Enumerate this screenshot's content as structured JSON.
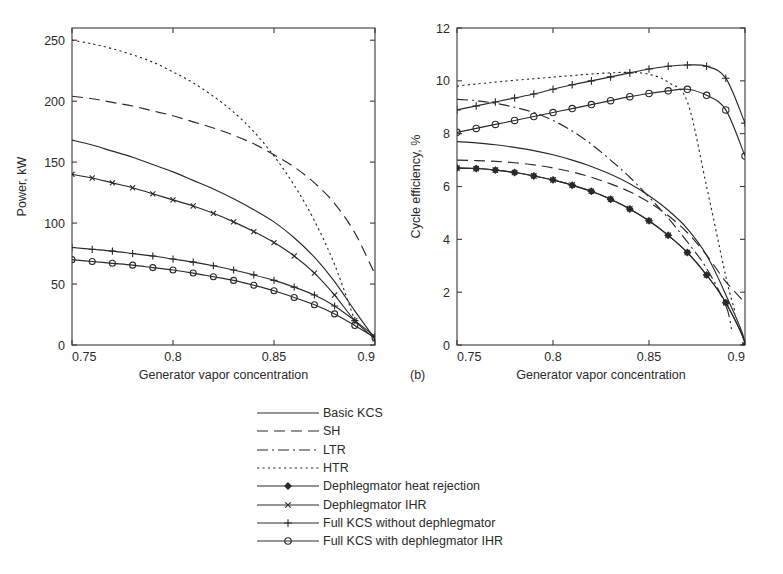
{
  "figure": {
    "panels": [
      {
        "id": "a",
        "letter": "",
        "xlabel": "Generator vapor concentration",
        "ylabel": "Power, kW",
        "xticks": [
          "0.75",
          "0.8",
          "0.85",
          "0.9"
        ],
        "yticks": [
          "0",
          "50",
          "100",
          "150",
          "200",
          "250"
        ]
      },
      {
        "id": "b",
        "letter": "(b)",
        "xlabel": "Generator vapor concentration",
        "ylabel": "Cycle efficiency, %",
        "xticks": [
          "0.75",
          "0.8",
          "0.85",
          "0.9"
        ],
        "yticks": [
          "0",
          "2",
          "4",
          "6",
          "8",
          "10",
          "12"
        ]
      }
    ]
  },
  "legend": {
    "items": [
      {
        "label": "Basic KCS",
        "style": "solid",
        "marker": "none"
      },
      {
        "label": "SH",
        "style": "dashed",
        "marker": "none"
      },
      {
        "label": "LTR",
        "style": "dashdot",
        "marker": "none"
      },
      {
        "label": "HTR",
        "style": "dotted",
        "marker": "none"
      },
      {
        "label": "Dephlegmator heat rejection",
        "style": "solid",
        "marker": "diamond"
      },
      {
        "label": "Dephlegmator IHR",
        "style": "solid",
        "marker": "cross"
      },
      {
        "label": "Full KCS without dephlegmator",
        "style": "solid",
        "marker": "plus"
      },
      {
        "label": "Full KCS with dephlegmator IHR",
        "style": "solid",
        "marker": "circle"
      }
    ]
  },
  "caption": {
    "text": ""
  },
  "chart_data": [
    {
      "type": "line",
      "panel": "a",
      "title": "",
      "xlabel": "Generator vapor concentration",
      "ylabel": "Power, kW",
      "xlim": [
        0.75,
        0.9
      ],
      "ylim": [
        0,
        260
      ],
      "xticks": [
        0.75,
        0.8,
        0.85,
        0.9
      ],
      "yticks": [
        0,
        50,
        100,
        150,
        200,
        250
      ],
      "grid": false,
      "legend_position": "below-figure",
      "x": [
        0.75,
        0.76,
        0.77,
        0.78,
        0.79,
        0.8,
        0.81,
        0.82,
        0.83,
        0.84,
        0.85,
        0.86,
        0.87,
        0.88,
        0.89,
        0.9
      ],
      "series": [
        {
          "name": "Basic KCS",
          "style": "solid",
          "marker": "none",
          "values": [
            168,
            164,
            159,
            154,
            148,
            142,
            135,
            128,
            120,
            111,
            101,
            88,
            72,
            52,
            28,
            5
          ]
        },
        {
          "name": "SH",
          "style": "dashed",
          "marker": "none",
          "values": [
            204,
            202,
            199,
            196,
            192,
            188,
            183,
            178,
            172,
            165,
            156,
            146,
            133,
            116,
            92,
            58
          ]
        },
        {
          "name": "LTR",
          "style": "dashdot",
          "marker": "none",
          "values": [
            null,
            null,
            null,
            null,
            null,
            null,
            null,
            null,
            null,
            null,
            null,
            null,
            null,
            null,
            null,
            null
          ]
        },
        {
          "name": "HTR",
          "style": "dotted",
          "marker": "none",
          "values": [
            250,
            247,
            243,
            238,
            232,
            224,
            215,
            204,
            191,
            175,
            155,
            131,
            102,
            66,
            20,
            null
          ]
        },
        {
          "name": "Dephlegmator heat rejection",
          "style": "solid",
          "marker": "diamond",
          "values": [
            null,
            null,
            null,
            null,
            null,
            null,
            null,
            null,
            null,
            null,
            null,
            null,
            null,
            null,
            null,
            null
          ]
        },
        {
          "name": "Dephlegmator IHR",
          "style": "solid",
          "marker": "cross",
          "values": [
            140,
            137,
            133,
            129,
            124,
            119,
            114,
            108,
            101,
            93,
            84,
            73,
            59,
            41,
            20,
            5
          ]
        },
        {
          "name": "Full KCS without dephlegmator",
          "style": "solid",
          "marker": "plus",
          "values": [
            80,
            78.5,
            77,
            75,
            73,
            70.5,
            68,
            65,
            61.5,
            57.5,
            53,
            47.5,
            41,
            32,
            20,
            7
          ]
        },
        {
          "name": "Full KCS with dephlegmator IHR",
          "style": "solid",
          "marker": "circle",
          "values": [
            70,
            68.5,
            67,
            65.5,
            63.5,
            61.5,
            59,
            56,
            53,
            49,
            44.5,
            39,
            33,
            25.5,
            16,
            6
          ]
        }
      ]
    },
    {
      "type": "line",
      "panel": "b",
      "title": "",
      "xlabel": "Generator vapor concentration",
      "ylabel": "Cycle efficiency, %",
      "xlim": [
        0.75,
        0.9
      ],
      "ylim": [
        0,
        12
      ],
      "xticks": [
        0.75,
        0.8,
        0.85,
        0.9
      ],
      "yticks": [
        0,
        2,
        4,
        6,
        8,
        10,
        12
      ],
      "grid": false,
      "legend_position": "below-figure",
      "x": [
        0.75,
        0.76,
        0.77,
        0.78,
        0.79,
        0.8,
        0.81,
        0.82,
        0.83,
        0.84,
        0.85,
        0.86,
        0.87,
        0.88,
        0.89,
        0.9
      ],
      "series": [
        {
          "name": "Basic KCS",
          "style": "solid",
          "marker": "none",
          "values": [
            7.7,
            7.65,
            7.58,
            7.48,
            7.36,
            7.2,
            7.0,
            6.76,
            6.46,
            6.1,
            5.65,
            5.1,
            4.4,
            3.4,
            1.9,
            0.05
          ]
        },
        {
          "name": "SH",
          "style": "dashed",
          "marker": "none",
          "values": [
            7.0,
            6.98,
            6.95,
            6.9,
            6.82,
            6.7,
            6.55,
            6.35,
            6.1,
            5.8,
            5.4,
            4.9,
            4.25,
            3.4,
            2.4,
            1.6
          ]
        },
        {
          "name": "LTR",
          "style": "dashdot",
          "marker": "none",
          "values": [
            9.3,
            9.25,
            9.15,
            9.0,
            8.8,
            8.5,
            8.1,
            7.6,
            7.0,
            6.35,
            5.6,
            4.8,
            3.9,
            2.9,
            1.5,
            null
          ]
        },
        {
          "name": "HTR",
          "style": "dotted",
          "marker": "none",
          "values": [
            9.8,
            9.88,
            9.95,
            10.02,
            10.08,
            10.14,
            10.2,
            10.26,
            10.3,
            10.32,
            10.25,
            9.95,
            9.2,
            6.0,
            2.6,
            null
          ]
        },
        {
          "name": "Dephlegmator heat rejection",
          "style": "solid",
          "marker": "diamond",
          "values": [
            6.7,
            6.68,
            6.62,
            6.53,
            6.4,
            6.25,
            6.05,
            5.82,
            5.52,
            5.15,
            4.7,
            4.15,
            3.5,
            2.65,
            1.6,
            0.0
          ]
        },
        {
          "name": "Dephlegmator IHR",
          "style": "solid",
          "marker": "cross",
          "values": [
            6.7,
            6.68,
            6.62,
            6.53,
            6.4,
            6.25,
            6.05,
            5.82,
            5.52,
            5.15,
            4.7,
            4.15,
            3.5,
            2.65,
            1.6,
            0.0
          ]
        },
        {
          "name": "Full KCS without dephlegmator",
          "style": "solid",
          "marker": "plus",
          "values": [
            8.9,
            9.05,
            9.2,
            9.35,
            9.5,
            9.68,
            9.85,
            10.0,
            10.15,
            10.3,
            10.45,
            10.55,
            10.6,
            10.55,
            10.1,
            8.4
          ]
        },
        {
          "name": "Full KCS with dephlegmator IHR",
          "style": "solid",
          "marker": "circle",
          "values": [
            8.05,
            8.2,
            8.35,
            8.5,
            8.65,
            8.8,
            8.95,
            9.1,
            9.25,
            9.4,
            9.52,
            9.62,
            9.68,
            9.45,
            8.9,
            7.15
          ]
        }
      ]
    }
  ]
}
